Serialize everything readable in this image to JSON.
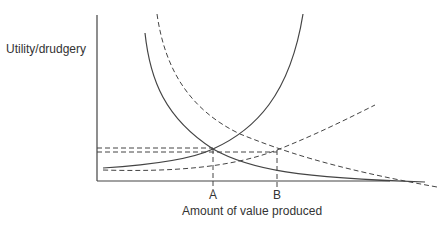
{
  "diagram": {
    "y_axis_label": "Utility/drudgery",
    "x_axis_label": "Amount of value produced",
    "points": [
      {
        "label": "A",
        "x": 213
      },
      {
        "label": "B",
        "x": 277
      }
    ],
    "curves": [
      {
        "name": "marginal-utility-original",
        "style": "solid",
        "trend": "decreasing"
      },
      {
        "name": "marginal-drudgery-original",
        "style": "solid",
        "trend": "increasing"
      },
      {
        "name": "marginal-utility-shifted",
        "style": "dashed",
        "trend": "decreasing"
      },
      {
        "name": "marginal-drudgery-shifted",
        "style": "dashed",
        "trend": "increasing"
      }
    ],
    "colors": {
      "line": "#333333",
      "text": "#333333",
      "background": "#ffffff"
    }
  }
}
